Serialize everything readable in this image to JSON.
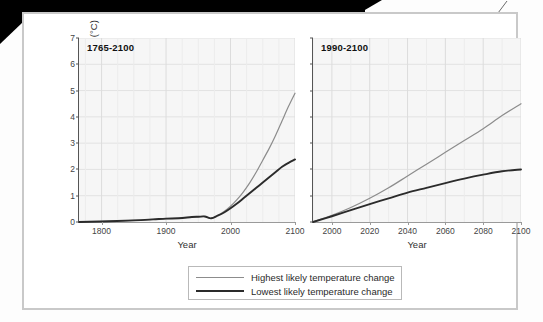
{
  "figure": {
    "ylabel": "Temperature change (°C)",
    "xlabel": "Year",
    "yticks": [
      "0",
      "1",
      "2",
      "3",
      "4",
      "5",
      "6",
      "7"
    ],
    "legend": [
      {
        "label": "Highest likely temperature change",
        "series": "high",
        "color": "#8c8c8c"
      },
      {
        "label": "Lowest likely temperature change",
        "series": "low",
        "color": "#2b2b2b"
      }
    ]
  },
  "panels": [
    {
      "title": "1765-2100",
      "xticks": [
        "1800",
        "1900",
        "2000",
        "2100"
      ]
    },
    {
      "title": "1990-2100",
      "xticks": [
        "2000",
        "2020",
        "2040",
        "2060",
        "2080",
        "2100"
      ]
    }
  ],
  "chart_data": [
    {
      "type": "line",
      "title": "1765-2100",
      "xlabel": "Year",
      "ylabel": "Temperature change (°C)",
      "xlim": [
        1765,
        2100
      ],
      "ylim": [
        0,
        7
      ],
      "xticks": [
        1800,
        1900,
        2000,
        2100
      ],
      "yticks": [
        0,
        1,
        2,
        3,
        4,
        5,
        6,
        7
      ],
      "grid": true,
      "legend_position": "below-figure",
      "x": [
        1765,
        1800,
        1850,
        1880,
        1900,
        1920,
        1940,
        1950,
        1960,
        1970,
        1980,
        1990,
        2000,
        2010,
        2020,
        2030,
        2040,
        2050,
        2060,
        2070,
        2080,
        2090,
        2100
      ],
      "series": [
        {
          "name": "Highest likely temperature change",
          "color": "#8c8c8c",
          "values": [
            0.0,
            0.02,
            0.06,
            0.1,
            0.13,
            0.14,
            0.19,
            0.2,
            0.21,
            0.14,
            0.25,
            0.4,
            0.6,
            0.85,
            1.15,
            1.5,
            1.9,
            2.35,
            2.8,
            3.3,
            3.85,
            4.4,
            4.9
          ]
        },
        {
          "name": "Lowest likely temperature change",
          "color": "#2b2b2b",
          "values": [
            0.0,
            0.02,
            0.06,
            0.1,
            0.13,
            0.14,
            0.19,
            0.2,
            0.21,
            0.14,
            0.24,
            0.36,
            0.52,
            0.7,
            0.9,
            1.1,
            1.3,
            1.5,
            1.7,
            1.9,
            2.1,
            2.25,
            2.38
          ]
        }
      ]
    },
    {
      "type": "line",
      "title": "1990-2100",
      "xlabel": "Year",
      "ylabel": "Temperature change (°C)",
      "xlim": [
        1990,
        2100
      ],
      "ylim": [
        0,
        7
      ],
      "xticks": [
        2000,
        2020,
        2040,
        2060,
        2080,
        2100
      ],
      "yticks": [
        0,
        1,
        2,
        3,
        4,
        5,
        6,
        7
      ],
      "grid": true,
      "legend_position": "below-figure",
      "x": [
        1990,
        2000,
        2010,
        2020,
        2030,
        2040,
        2050,
        2060,
        2070,
        2080,
        2090,
        2100
      ],
      "series": [
        {
          "name": "Highest likely temperature change",
          "color": "#8c8c8c",
          "values": [
            0.0,
            0.25,
            0.55,
            0.9,
            1.3,
            1.75,
            2.2,
            2.65,
            3.1,
            3.55,
            4.05,
            4.5
          ]
        },
        {
          "name": "Lowest likely temperature change",
          "color": "#2b2b2b",
          "values": [
            0.0,
            0.22,
            0.45,
            0.68,
            0.9,
            1.12,
            1.3,
            1.48,
            1.65,
            1.8,
            1.93,
            2.0
          ]
        }
      ]
    }
  ]
}
